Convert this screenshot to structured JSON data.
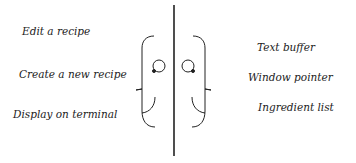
{
  "left_labels": [
    {
      "text": "Edit a recipe",
      "x": 22,
      "y": 25
    },
    {
      "text": "Create a new recipe",
      "x": 19,
      "y": 68
    },
    {
      "text": "Display on terminal",
      "x": 13,
      "y": 108
    }
  ],
  "right_labels": [
    {
      "text": "Text buffer",
      "x": 257,
      "y": 41
    },
    {
      "text": "Window pointer",
      "x": 248,
      "y": 71
    },
    {
      "text": "Ingredient list",
      "x": 258,
      "y": 101
    }
  ],
  "colors": {
    "stroke": "#222222",
    "background": "#ffffff"
  }
}
